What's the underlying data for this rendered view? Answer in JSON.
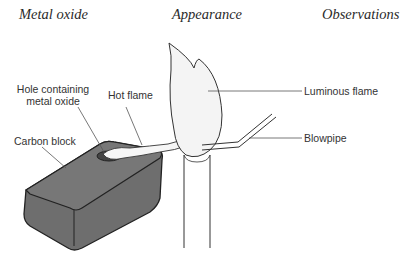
{
  "headers": {
    "col1": "Metal oxide",
    "col2": "Appearance",
    "col3": "Observations"
  },
  "labels": {
    "hole_line1": "Hole containing",
    "hole_line2": "metal oxide",
    "hot_flame": "Hot flame",
    "carbon_block": "Carbon block",
    "luminous_flame": "Luminous flame",
    "blowpipe": "Blowpipe"
  },
  "colors": {
    "block_fill": "#6e6e6e",
    "block_top": "#7a7a7a",
    "outline": "#222222",
    "flame_fill": "#f4f4f4"
  }
}
